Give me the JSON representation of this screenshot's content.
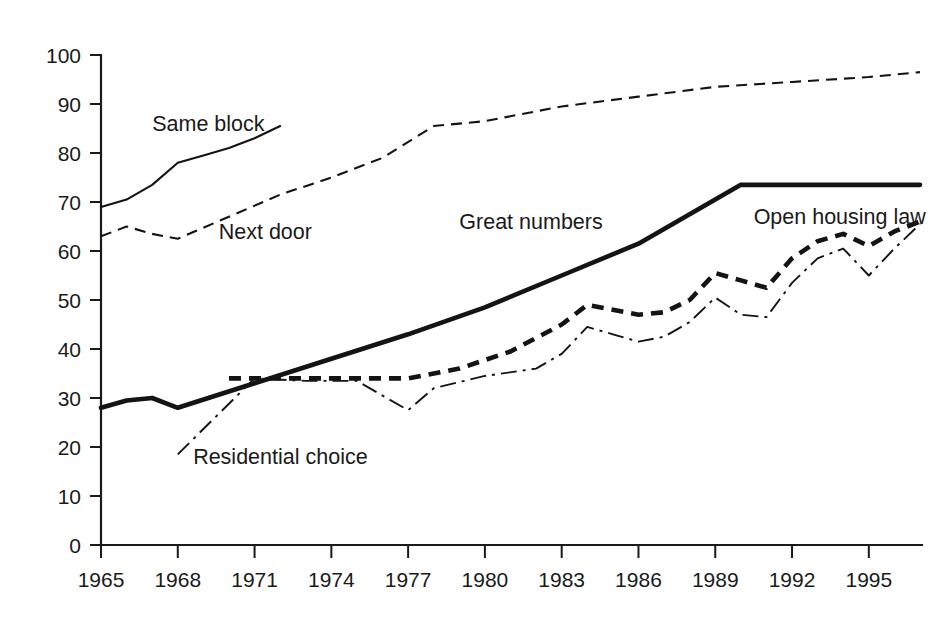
{
  "chart_data": {
    "type": "line",
    "title": "",
    "subtitle": "",
    "xlabel": "",
    "ylabel": "",
    "xlim": [
      1965,
      1997
    ],
    "ylim": [
      0,
      100
    ],
    "grid": false,
    "legend_position": "inline-annotations",
    "x_ticks": [
      1965,
      1968,
      1971,
      1974,
      1977,
      1980,
      1983,
      1986,
      1989,
      1992,
      1995
    ],
    "y_ticks": [
      0,
      10,
      20,
      30,
      40,
      50,
      60,
      70,
      80,
      90,
      100
    ],
    "series": [
      {
        "name": "Same block",
        "style": "solid-thin",
        "label_x": 1967.0,
        "label_y": 84.5,
        "x": [
          1965,
          1966,
          1967,
          1968,
          1969,
          1970,
          1971,
          1972
        ],
        "values": [
          69,
          70.5,
          73.5,
          78,
          79.5,
          81,
          83,
          85.5
        ]
      },
      {
        "name": "Next door",
        "style": "dashed-thin",
        "label_x": 1969.6,
        "label_y": 62.5,
        "x": [
          1965,
          1966,
          1967,
          1968,
          1970,
          1972,
          1974,
          1976,
          1978,
          1980,
          1983,
          1986,
          1989,
          1992,
          1995,
          1997
        ],
        "values": [
          63,
          65,
          63.5,
          62.5,
          67,
          71.5,
          75,
          79,
          85.5,
          86.5,
          89.5,
          91.5,
          93.5,
          94.5,
          95.5,
          96.5
        ]
      },
      {
        "name": "Great numbers",
        "style": "solid-thick",
        "label_x": 1979.0,
        "label_y": 64.5,
        "x": [
          1965,
          1966,
          1967,
          1968,
          1971,
          1974,
          1977,
          1980,
          1983,
          1986,
          1989,
          1990,
          1993,
          1997
        ],
        "values": [
          28,
          29.5,
          30,
          28,
          33,
          38,
          43,
          48.5,
          55,
          61.5,
          70.5,
          73.5,
          73.5,
          73.5
        ]
      },
      {
        "name": "Open housing law",
        "style": "dashed-thick",
        "label_x": 1990.5,
        "label_y": 65.5,
        "x": [
          1970,
          1972,
          1974,
          1977,
          1979,
          1981,
          1983,
          1984,
          1985,
          1986,
          1987,
          1988,
          1989,
          1990,
          1991,
          1992,
          1993,
          1994,
          1995,
          1996,
          1997
        ],
        "values": [
          34,
          34,
          34,
          34,
          36,
          39.5,
          45,
          49,
          48,
          47,
          47.5,
          50,
          55.5,
          54,
          52.5,
          58.5,
          62,
          63.5,
          61,
          64,
          66
        ]
      },
      {
        "name": "Residential choice",
        "style": "dash-dot-thin",
        "label_x": 1968.6,
        "label_y": 16.5,
        "x": [
          1968,
          1971,
          1973,
          1975,
          1977,
          1978,
          1980,
          1982,
          1983,
          1984,
          1985,
          1986,
          1987,
          1988,
          1989,
          1990,
          1991,
          1992,
          1993,
          1994,
          1995,
          1996,
          1997
        ],
        "values": [
          18.5,
          34,
          33.5,
          33.5,
          27.5,
          32,
          34.5,
          36,
          39,
          44.5,
          43,
          41.5,
          42.5,
          45.5,
          50.5,
          47,
          46.5,
          53.5,
          58.5,
          60.5,
          55,
          60.5,
          65.5
        ]
      }
    ]
  },
  "axis": {
    "y_labels": [
      "0",
      "10",
      "20",
      "30",
      "40",
      "50",
      "60",
      "70",
      "80",
      "90",
      "100"
    ],
    "x_labels": [
      "1965",
      "1968",
      "1971",
      "1974",
      "1977",
      "1980",
      "1983",
      "1986",
      "1989",
      "1992",
      "1995"
    ]
  },
  "labels": {
    "same_block": "Same block",
    "next_door": "Next door",
    "great_numbers": "Great numbers",
    "open_housing_law": "Open housing law",
    "residential_choice": "Residential choice"
  },
  "colors": {
    "ink": "#1a1a1a",
    "background": "#ffffff"
  }
}
